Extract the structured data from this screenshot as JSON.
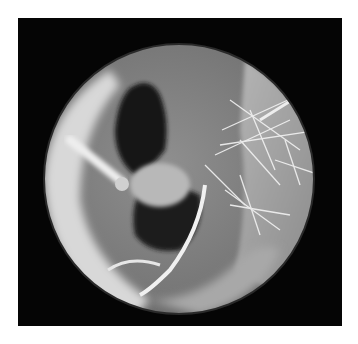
{
  "image": {
    "type": "endoscopic-view",
    "description": "Circular otoscopic view of an ear canal with hairs and bright reflections",
    "frame_color": "#050505",
    "background_color": "#ffffff",
    "view": {
      "cx": 179,
      "cy": 179,
      "r": 135
    },
    "colors": {
      "tissue_light": "#c8c8c8",
      "tissue_mid": "#8a8a8a",
      "tissue_dark": "#4a4a4a",
      "cavity": "#1a1a1a",
      "highlight": "#f2f2f2"
    }
  }
}
